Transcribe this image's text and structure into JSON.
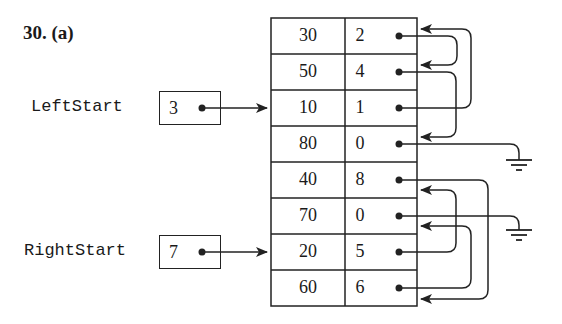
{
  "title": "30. (a)",
  "pointers": [
    {
      "label": "LeftStart",
      "value": "3"
    },
    {
      "label": "RightStart",
      "value": "7"
    }
  ],
  "table": {
    "columns": [
      "value",
      "next"
    ],
    "rows": [
      {
        "value": "30",
        "next": "2"
      },
      {
        "value": "50",
        "next": "4"
      },
      {
        "value": "10",
        "next": "1"
      },
      {
        "value": "80",
        "next": "0"
      },
      {
        "value": "40",
        "next": "8"
      },
      {
        "value": "70",
        "next": "0"
      },
      {
        "value": "20",
        "next": "5"
      },
      {
        "value": "60",
        "next": "6"
      }
    ]
  },
  "colors": {
    "ink": "#222222",
    "background": "#ffffff"
  }
}
